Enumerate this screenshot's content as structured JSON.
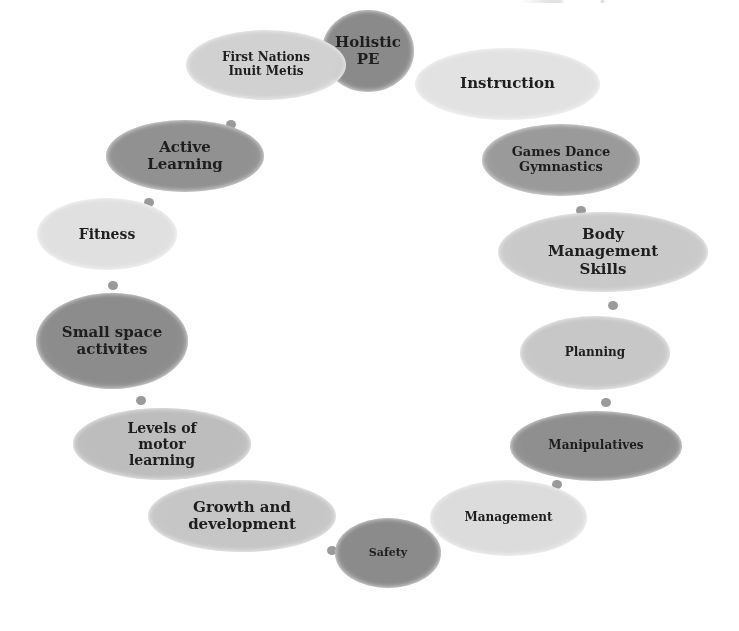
{
  "diagram": {
    "type": "cycle",
    "nodes": [
      {
        "id": "holistic-pe",
        "label": "Holistic PE",
        "lines": [
          "Holistic",
          "PE"
        ],
        "fill": "#8a8a8a",
        "x": 322,
        "y": 10,
        "w": 92,
        "h": 82,
        "font": 15
      },
      {
        "id": "instruction",
        "label": "Instruction",
        "lines": [
          "Instruction"
        ],
        "fill": "#e2e2e2",
        "x": 415,
        "y": 48,
        "w": 185,
        "h": 72,
        "font": 15
      },
      {
        "id": "games-dance-gymnastics",
        "label": "Games Dance Gymnastics",
        "lines": [
          "Games Dance",
          "Gymnastics"
        ],
        "fill": "#9a9a9a",
        "x": 482,
        "y": 124,
        "w": 158,
        "h": 72,
        "font": 13
      },
      {
        "id": "body-management-skills",
        "label": "Body Management Skills",
        "lines": [
          "Body",
          "Management",
          "Skills"
        ],
        "fill": "#c9c9c9",
        "x": 498,
        "y": 212,
        "w": 210,
        "h": 80,
        "font": 15
      },
      {
        "id": "planning",
        "label": "Planning",
        "lines": [
          "Planning"
        ],
        "fill": "#c7c7c7",
        "x": 520,
        "y": 316,
        "w": 150,
        "h": 74,
        "font": 12
      },
      {
        "id": "manipulatives",
        "label": "Manipulatives",
        "lines": [
          "Manipulatives"
        ],
        "fill": "#8f8f8f",
        "x": 510,
        "y": 411,
        "w": 172,
        "h": 70,
        "font": 12
      },
      {
        "id": "management",
        "label": "Management",
        "lines": [
          "Management"
        ],
        "fill": "#dcdcdc",
        "x": 430,
        "y": 480,
        "w": 157,
        "h": 76,
        "font": 12
      },
      {
        "id": "safety",
        "label": "Safety",
        "lines": [
          "Safety"
        ],
        "fill": "#8b8b8b",
        "x": 335,
        "y": 518,
        "w": 106,
        "h": 70,
        "font": 11
      },
      {
        "id": "growth-and-development",
        "label": "Growth and development",
        "lines": [
          "Growth and",
          "development"
        ],
        "fill": "#c6c6c6",
        "x": 148,
        "y": 480,
        "w": 188,
        "h": 72,
        "font": 15
      },
      {
        "id": "levels-of-motor-learning",
        "label": "Levels of motor learning",
        "lines": [
          "Levels of",
          "motor",
          "learning"
        ],
        "fill": "#bdbdbd",
        "x": 73,
        "y": 408,
        "w": 178,
        "h": 72,
        "font": 14
      },
      {
        "id": "small-space-activites",
        "label": "Small space activites",
        "lines": [
          "Small space",
          "activites"
        ],
        "fill": "#8c8c8c",
        "x": 36,
        "y": 293,
        "w": 152,
        "h": 96,
        "font": 15
      },
      {
        "id": "fitness",
        "label": "Fitness",
        "lines": [
          "Fitness"
        ],
        "fill": "#e0e0e0",
        "x": 37,
        "y": 198,
        "w": 140,
        "h": 72,
        "font": 14
      },
      {
        "id": "active-learning",
        "label": "Active Learning",
        "lines": [
          "Active",
          "Learning"
        ],
        "fill": "#919191",
        "x": 106,
        "y": 120,
        "w": 158,
        "h": 72,
        "font": 15
      },
      {
        "id": "first-nations-inuit-metis",
        "label": "First Nations Inuit Metis",
        "lines": [
          "First Nations",
          "Inuit Metis"
        ],
        "fill": "#d1d1d1",
        "x": 186,
        "y": 30,
        "w": 160,
        "h": 70,
        "font": 12
      }
    ],
    "connectors": [
      {
        "x": 576,
        "y": 206
      },
      {
        "x": 608,
        "y": 301
      },
      {
        "x": 601,
        "y": 398
      },
      {
        "x": 552,
        "y": 480
      },
      {
        "x": 327,
        "y": 546
      },
      {
        "x": 196,
        "y": 487
      },
      {
        "x": 136,
        "y": 396
      },
      {
        "x": 108,
        "y": 281
      },
      {
        "x": 144,
        "y": 198
      },
      {
        "x": 226,
        "y": 120
      }
    ]
  }
}
